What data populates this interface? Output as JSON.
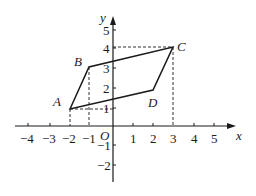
{
  "diagram": {
    "type": "coordinate-plane-parallelogram",
    "axes": {
      "x_label": "x",
      "y_label": "y",
      "origin_label": "O",
      "x_ticks": [
        "-4",
        "-3",
        "-2",
        "-1",
        "1",
        "2",
        "3",
        "4",
        "5"
      ],
      "y_ticks": [
        "5",
        "4",
        "3",
        "2",
        "1",
        "-1",
        "-2"
      ]
    },
    "points": [
      {
        "label": "A",
        "x": -2,
        "y": 1
      },
      {
        "label": "B",
        "x": -1,
        "y": 3
      },
      {
        "label": "C",
        "x": 3,
        "y": 4
      },
      {
        "label": "D",
        "x": 2,
        "y": 2
      }
    ],
    "shape": "parallelogram ABCD",
    "guide_lines": [
      "dashed vertical from A to x-axis at -2",
      "dashed vertical from B to x-axis at -1",
      "dashed vertical from C to x-axis at 3",
      "dashed horizontal from C to y-axis at 4",
      "dashed horizontal from A to y-axis at 1"
    ]
  },
  "labels": {
    "x": "x",
    "y": "y",
    "o": "O",
    "A": "A",
    "B": "B",
    "C": "C",
    "D": "D",
    "xt": {
      "m4": "−4",
      "m3": "−3",
      "m2": "−2",
      "m1": "−1",
      "p1": "1",
      "p2": "2",
      "p3": "3",
      "p4": "4",
      "p5": "5"
    },
    "yt": {
      "p5": "5",
      "p4": "4",
      "p3": "3",
      "p2": "2",
      "p1": "1",
      "m1": "−1",
      "m2": "−2"
    }
  }
}
